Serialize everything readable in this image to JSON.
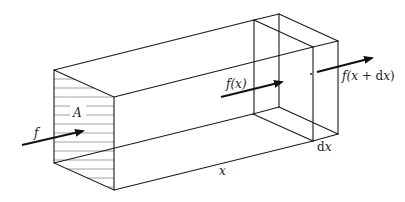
{
  "diagram": {
    "type": "3d-prism-flux-element",
    "labels": {
      "area": "A",
      "input_flux": "f",
      "flux_at_x": "f(x)",
      "flux_at_x_dx_prefix": "f(",
      "flux_at_x_dx_var": "x",
      "flux_at_x_dx_plus": " + d",
      "flux_at_x_dx_var2": "x",
      "flux_at_x_dx_suffix": ")",
      "position": "x",
      "increment_d": "d",
      "increment_x": "x"
    },
    "colors": {
      "edges": "#1a1a1a",
      "hatching": "#8a8a8a",
      "arrows": "#111111",
      "background": "#ffffff"
    }
  }
}
